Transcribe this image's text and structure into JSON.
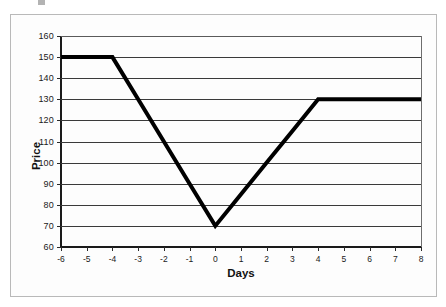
{
  "chart_data": {
    "type": "line",
    "title": "",
    "xlabel": "Days",
    "ylabel": "Price",
    "x": [
      -6,
      -5,
      -4,
      -3,
      -2,
      -1,
      0,
      1,
      2,
      3,
      4,
      5,
      6,
      7,
      8
    ],
    "values": [
      150,
      150,
      150,
      130,
      110,
      90,
      70,
      85,
      100,
      115,
      130,
      130,
      130,
      130,
      130
    ],
    "series": [
      {
        "name": "Price",
        "values": [
          150,
          150,
          150,
          130,
          110,
          90,
          70,
          85,
          100,
          115,
          130,
          130,
          130,
          130,
          130
        ]
      }
    ],
    "xlim": [
      -6,
      8
    ],
    "ylim": [
      60,
      160
    ],
    "x_tick_labels": [
      "-6",
      "-5",
      "-4",
      "-3",
      "-2",
      "-1",
      "0",
      "1",
      "2",
      "3",
      "4",
      "5",
      "6",
      "7",
      "8"
    ],
    "y_tick_labels": [
      "160",
      "150",
      "140",
      "130",
      "120",
      "110",
      "100",
      "90",
      "80",
      "70",
      "60"
    ],
    "y_ticks": [
      160,
      150,
      140,
      130,
      120,
      110,
      100,
      90,
      80,
      70,
      60
    ],
    "y_tick_step": 10,
    "grid": "horizontal",
    "legend": "none",
    "line_color": "#000000",
    "line_width": 4,
    "gridline_color": "#3a3a3a",
    "plot_background": "#ffffff",
    "frame_border_color": "#b9b9b9",
    "annotations": []
  }
}
